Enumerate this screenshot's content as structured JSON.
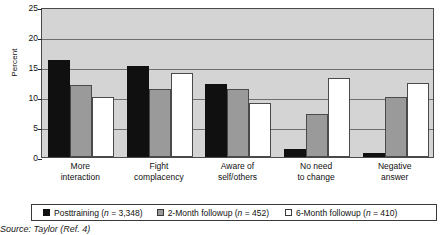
{
  "chart_data": {
    "type": "bar",
    "title": "",
    "xlabel": "",
    "ylabel": "Percent",
    "ylim": [
      0,
      25
    ],
    "yticks": [
      0,
      5,
      10,
      15,
      20,
      25
    ],
    "grid": true,
    "legend_position": "bottom",
    "categories": [
      "More interaction",
      "Fight complacency",
      "Aware of self/others",
      "No need to change",
      "Negative answer"
    ],
    "category_lines": [
      [
        "More",
        "interaction"
      ],
      [
        "Fight",
        "complacency"
      ],
      [
        "Aware of",
        "self/others"
      ],
      [
        "No need",
        "to change"
      ],
      [
        "Negative",
        "answer"
      ]
    ],
    "series": [
      {
        "name": "Posttraining",
        "n": "3,348",
        "color": "#101010",
        "values": [
          16.1,
          15.1,
          12.2,
          1.3,
          0.6
        ]
      },
      {
        "name": "2-Month followup",
        "n": "452",
        "color": "#9a9a9a",
        "values": [
          12.0,
          11.3,
          11.3,
          7.2,
          10.0
        ]
      },
      {
        "name": "6-Month followup",
        "n": "410",
        "color": "#ffffff",
        "values": [
          10.0,
          14.0,
          9.0,
          13.1,
          12.4
        ]
      }
    ]
  },
  "legend": {
    "items": [
      {
        "label": "Posttraining (n = 3,348)",
        "name_part": "Posttraining (",
        "n_part": "n",
        "tail": " = 3,348)"
      },
      {
        "label": "2-Month followup (n = 452)",
        "name_part": "2-Month followup (",
        "n_part": "n",
        "tail": " = 452)"
      },
      {
        "label": "6-Month followup (n = 410)",
        "name_part": "6-Month followup (",
        "n_part": "n",
        "tail": " = 410)"
      }
    ]
  },
  "caption": {
    "source": "Source: Taylor (Ref. 4)"
  },
  "axis": {
    "y_title": "Percent",
    "y_tick_labels": [
      "25",
      "20",
      "15",
      "10",
      "5",
      "0"
    ]
  }
}
